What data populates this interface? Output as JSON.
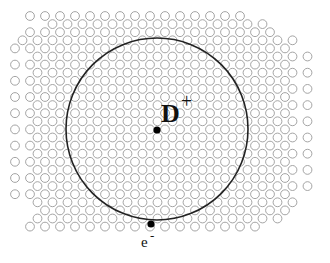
{
  "diagram": {
    "labels": {
      "donor": "D",
      "donor_charge": "+",
      "electron": "e",
      "electron_charge": "-"
    },
    "lattice": {
      "type": "hexagonal",
      "circle_radius": 4.4,
      "pitch_x": 15,
      "pitch_y": 8.1,
      "rows": 27,
      "origin_x": 30,
      "origin_y": 16,
      "stroke": "#9a9a9a"
    },
    "orbit": {
      "cx": 157,
      "cy": 129,
      "r": 91,
      "stroke": "#222222"
    },
    "donor_point": {
      "cx": 157,
      "cy": 130,
      "r": 3.6
    },
    "electron_point": {
      "cx": 151,
      "cy": 224,
      "r": 3.6
    },
    "colors": {
      "background": "#ffffff",
      "lattice": "#9a9a9a",
      "orbit": "#222222",
      "points": "#000000"
    }
  }
}
